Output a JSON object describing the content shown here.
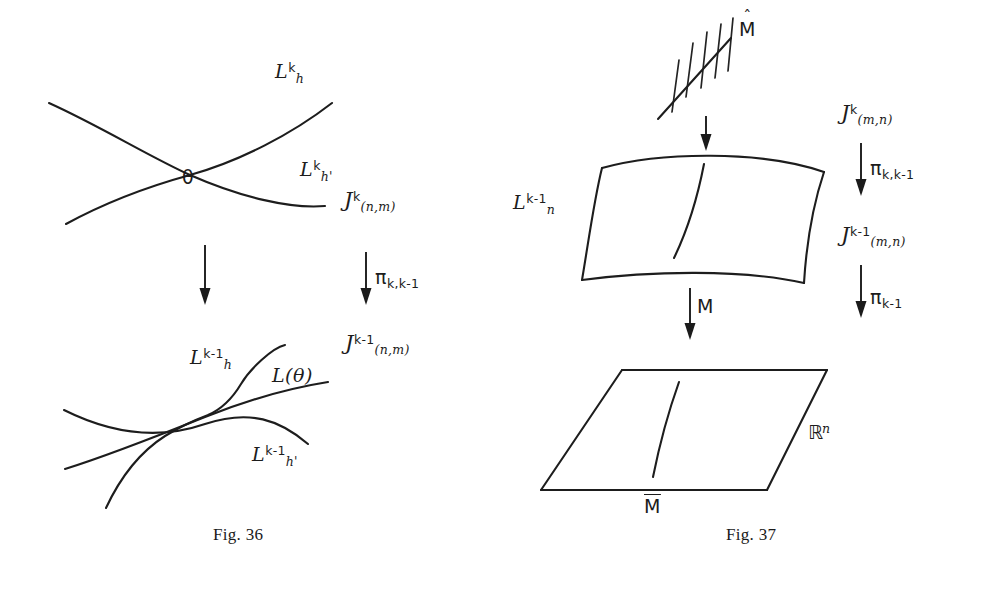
{
  "page": {
    "background_color": "#ffffff",
    "ink_color": "#1d1d1d",
    "width": 987,
    "height": 589
  },
  "figures": [
    {
      "id": "fig-36",
      "caption": "Fig. 36",
      "description": "Two crossing curves over theta mapping down to three mutually tangent curves",
      "top_panel": {
        "curve_labels": [
          {
            "name": "L-h-k",
            "base": "L",
            "sup": "k",
            "sub": "h"
          },
          {
            "name": "L-h-prime-k",
            "base": "L",
            "sup": "k",
            "sub": "h'"
          }
        ],
        "point_label": "θ"
      },
      "bottom_panel": {
        "curve_labels": [
          {
            "name": "L-h-k-minus-1",
            "base": "L",
            "sup": "k-1",
            "sub": "h"
          },
          {
            "name": "L-theta",
            "text": "L(θ)"
          },
          {
            "name": "L-h-prime-k-minus-1",
            "base": "L",
            "sup": "k-1",
            "sub": "h'"
          }
        ]
      },
      "space_labels": [
        {
          "name": "jet-space-k",
          "base": "J",
          "sup": "k",
          "sub": "(n,m)"
        },
        {
          "name": "jet-space-k-minus-1",
          "base": "J",
          "sup": "k-1",
          "sub": "(n,m)"
        }
      ],
      "arrows": [
        {
          "name": "projection-arrow-unlabeled",
          "label": ""
        },
        {
          "name": "projection-arrow-pi-k",
          "label": "π",
          "sub": "k,k-1"
        }
      ]
    },
    {
      "id": "fig-37",
      "caption": "Fig. 37",
      "description": "Hatched line M-hat projecting onto curved surface patch then onto plane R^n",
      "top_object": {
        "name": "hatched-line-m-hat",
        "label": {
          "base": "M",
          "accent": "hat"
        },
        "hatch_count": 5
      },
      "middle_object": {
        "name": "curved-surface-patch",
        "label": {
          "base": "L",
          "sup": "k-1",
          "sub": "n"
        }
      },
      "bottom_object": {
        "name": "plane-parallelogram",
        "label": {
          "base": "R",
          "sup": "n",
          "style": "blackboard"
        },
        "curve_label": {
          "base": "M",
          "accent": "bar"
        }
      },
      "space_labels": [
        {
          "name": "jet-space-k",
          "base": "J",
          "sup": "k",
          "sub": "(m,n)"
        },
        {
          "name": "jet-space-k-minus-1",
          "base": "J",
          "sup": "k-1",
          "sub": "(m,n)"
        }
      ],
      "arrows": [
        {
          "name": "inclusion-arrow-top",
          "label": ""
        },
        {
          "name": "map-arrow-m",
          "label": "M"
        },
        {
          "name": "projection-arrow-pi-k",
          "label": "π",
          "sub": "k,k-1"
        },
        {
          "name": "projection-arrow-pi-k-minus-1",
          "label": "π",
          "sub": "k-1"
        }
      ]
    }
  ],
  "labels": {
    "fig36": {
      "L_h_k_base": "L",
      "L_h_k_sup": "k",
      "L_h_k_sub": "h",
      "L_hp_k_base": "L",
      "L_hp_k_sup": "k",
      "L_hp_k_sub": "h'",
      "theta": "θ",
      "J_k_base": "J",
      "J_k_sup": "k",
      "J_k_sub": "(n,m)",
      "pi_base": "π",
      "pi_sub": "k,k-1",
      "J_km1_base": "J",
      "J_km1_sup": "k-1",
      "J_km1_sub": "(n,m)",
      "L_h_km1_base": "L",
      "L_h_km1_sup": "k-1",
      "L_h_km1_sub": "h",
      "L_theta": "L(θ)",
      "L_hp_km1_base": "L",
      "L_hp_km1_sup": "k-1",
      "L_hp_km1_sub": "h'",
      "caption": "Fig. 36"
    },
    "fig37": {
      "M_hat": "M",
      "hat_glyph": "ˆ",
      "L_n_base": "L",
      "L_n_sup": "k-1",
      "L_n_sub": "n",
      "J_k_base": "J",
      "J_k_sup": "k",
      "J_k_sub": "(m,n)",
      "pi_k_base": "π",
      "pi_k_sub": "k,k-1",
      "J_km1_base": "J",
      "J_km1_sup": "k-1",
      "J_km1_sub": "(m,n)",
      "pi_km1_base": "π",
      "pi_km1_sub": "k-1",
      "M_map": "M",
      "R_base": "ℝ",
      "R_sup": "n",
      "M_bar": "M",
      "caption": "Fig. 37"
    }
  }
}
